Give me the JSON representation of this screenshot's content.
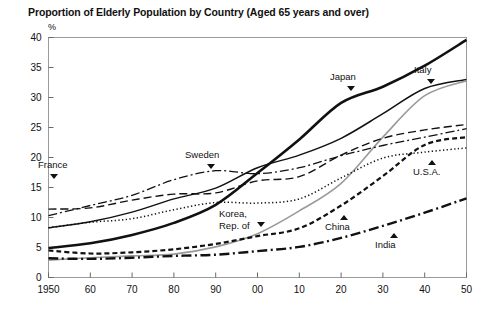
{
  "chart_data": {
    "type": "line",
    "title": "Proportion of Elderly Population by Country (Aged 65 years and over)",
    "xlabel": "",
    "ylabel": "%",
    "ylim": [
      0,
      40
    ],
    "xlim": [
      1950,
      2050
    ],
    "ytick_labels": [
      "0",
      "5",
      "10",
      "15",
      "20",
      "25",
      "30",
      "35",
      "40"
    ],
    "ytick_values": [
      0,
      5,
      10,
      15,
      20,
      25,
      30,
      35,
      40
    ],
    "xtick_labels": [
      "1950",
      "60",
      "70",
      "80",
      "90",
      "00",
      "10",
      "20",
      "30",
      "40",
      "50"
    ],
    "xtick_values": [
      1950,
      1960,
      1970,
      1980,
      1990,
      2000,
      2010,
      2020,
      2030,
      2040,
      2050
    ],
    "grid": false,
    "legend": "inline-annotations",
    "x": [
      1950,
      1960,
      1970,
      1980,
      1990,
      2000,
      2010,
      2020,
      2030,
      2040,
      2050
    ],
    "series": [
      {
        "name": "Japan",
        "label": "Japan",
        "style": "solid-thick-black",
        "color": "#111111",
        "values": [
          4.9,
          5.7,
          7.1,
          9.1,
          12.1,
          17.4,
          23.0,
          29.1,
          31.8,
          35.3,
          39.6
        ]
      },
      {
        "name": "Italy",
        "label": "Italy",
        "style": "solid-medium-black",
        "color": "#111111",
        "values": [
          8.3,
          9.3,
          10.9,
          13.1,
          14.9,
          18.3,
          20.4,
          23.2,
          27.3,
          31.5,
          33.0
        ]
      },
      {
        "name": "Korea, Rep. of",
        "label": "Korea, Rep. of",
        "style": "solid-gray",
        "color": "#9a9a9a",
        "values": [
          2.9,
          3.3,
          3.6,
          3.9,
          5.1,
          7.3,
          11.1,
          15.7,
          23.4,
          30.3,
          32.8
        ]
      },
      {
        "name": "Sweden",
        "label": "Sweden",
        "style": "dash-dot-thin",
        "color": "#111111",
        "values": [
          10.3,
          12.0,
          13.7,
          16.3,
          17.8,
          17.3,
          18.3,
          20.3,
          22.0,
          23.4,
          24.8
        ]
      },
      {
        "name": "France",
        "label": "France",
        "style": "dashed-medium",
        "color": "#111111",
        "values": [
          11.4,
          11.6,
          12.9,
          13.9,
          14.1,
          16.1,
          16.8,
          20.4,
          23.2,
          24.6,
          25.5
        ]
      },
      {
        "name": "U.S.A.",
        "label": "U.S.A.",
        "style": "dotted",
        "color": "#111111",
        "values": [
          8.3,
          9.2,
          9.8,
          11.3,
          12.5,
          12.4,
          13.1,
          16.6,
          19.9,
          20.9,
          21.6
        ]
      },
      {
        "name": "China",
        "label": "China",
        "style": "dashed-short-thick",
        "color": "#111111",
        "values": [
          4.5,
          4.0,
          4.2,
          4.7,
          5.6,
          6.9,
          8.2,
          12.0,
          16.9,
          22.1,
          23.4
        ]
      },
      {
        "name": "India",
        "label": "India",
        "style": "dash-dot-thick",
        "color": "#111111",
        "values": [
          3.2,
          3.1,
          3.3,
          3.6,
          3.8,
          4.4,
          5.1,
          6.6,
          8.6,
          10.8,
          13.2
        ]
      }
    ],
    "annotations": [
      {
        "text": "France",
        "marker": "triangle-down",
        "x": 1955,
        "y": 15.0
      },
      {
        "text": "Sweden",
        "marker": "triangle-down",
        "x": 1990,
        "y": 21.5
      },
      {
        "text": "Korea,\nRep. of",
        "marker": "triangle-down",
        "x": 2002,
        "y": 10.5
      },
      {
        "text": "Japan",
        "marker": "triangle-down",
        "x": 2023,
        "y": 33.5
      },
      {
        "text": "Italy",
        "marker": "triangle-down",
        "x": 2042,
        "y": 36.0
      },
      {
        "text": "U.S.A.",
        "marker": "triangle-up",
        "x": 2042,
        "y": 19.5
      },
      {
        "text": "China",
        "marker": "triangle-up",
        "x": 2023,
        "y": 9.5
      },
      {
        "text": "India",
        "marker": "triangle-up",
        "x": 2033,
        "y": 6.3
      }
    ]
  },
  "annotation_labels": {
    "france": "France",
    "sweden": "Sweden",
    "korea_line1": "Korea,",
    "korea_line2": "Rep. of",
    "japan": "Japan",
    "italy": "Italy",
    "usa": "U.S.A.",
    "china": "China",
    "india": "India"
  }
}
